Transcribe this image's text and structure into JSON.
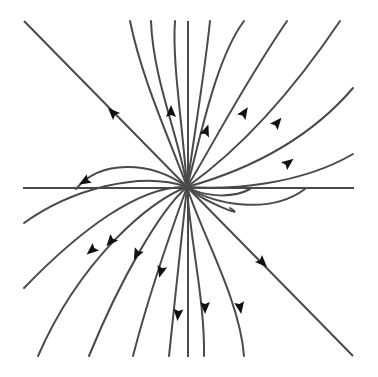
{
  "diagram": {
    "type": "phase-portrait",
    "colors": {
      "background": "#ffffff",
      "line": "#4a4a4a",
      "arrowhead": "#111111"
    },
    "center": [
      187,
      187
    ],
    "axes": {
      "horizontal": {
        "x1": 23,
        "y1": 188,
        "x2": 354,
        "y2": 188
      },
      "vertical": {
        "x1": 188,
        "y1": 21,
        "x2": 188,
        "y2": 357
      }
    },
    "eigenline": {
      "x1": 24,
      "y1": 21,
      "x2": 353,
      "y2": 356,
      "arrows": [
        [
          113,
          113,
          -1
        ],
        [
          262,
          262,
          1
        ]
      ]
    },
    "trajectories": [
      {
        "d": "M187,187 C170,140 142,80 130,21"
      },
      {
        "d": "M187,187 C180,140 153,80 151,21"
      },
      {
        "d": "M187,187 C182,120 172,60 175,21",
        "arrow": [
          171,
          112,
          -90
        ]
      },
      {
        "d": "M187,187 C195,130 205,70 210,21"
      },
      {
        "d": "M187,187 C200,140 215,60 244,21",
        "arrow": [
          206,
          131,
          -70
        ]
      },
      {
        "d": "M187,187 C210,150 240,90 287,21",
        "arrow": [
          244,
          113,
          -57
        ]
      },
      {
        "d": "M187,187 C225,160 280,110 340,21",
        "arrow": [
          277,
          123,
          -50
        ]
      },
      {
        "d": "M187,187 C230,175 300,150 353,88",
        "arrow": [
          288,
          163,
          -38
        ]
      },
      {
        "d": "M187,187 C230,190 300,185 353,154"
      },
      {
        "d": "M187,187 C150,160 100,160 76,189",
        "arrow": [
          85,
          181,
          150
        ]
      },
      {
        "d": "M187,187 C140,170 70,190 24,223"
      },
      {
        "d": "M187,187 C140,185 80,230 24,288",
        "arrow": [
          92,
          250,
          140
        ]
      },
      {
        "d": "M187,187 C150,200 80,260 38,356",
        "arrow": [
          111,
          241,
          130
        ]
      },
      {
        "d": "M187,187 C160,210 120,280 89,356",
        "arrow": [
          137,
          254,
          117
        ]
      },
      {
        "d": "M187,187 C175,220 150,290 133,356",
        "arrow": [
          161,
          271,
          105
        ]
      },
      {
        "d": "M187,187 C182,230 175,300 169,356",
        "arrow": [
          178,
          314,
          95
        ]
      },
      {
        "d": "M187,187 C190,240 205,300 204,356",
        "arrow": [
          205,
          307,
          90
        ]
      },
      {
        "d": "M187,187 C200,230 240,300 244,356",
        "arrow": [
          240,
          307,
          80
        ]
      },
      {
        "d": "M187,187 C200,200 250,220 230,208"
      },
      {
        "d": "M187,187 C215,205 270,215 305,189"
      },
      {
        "d": "M187,187 C200,195 230,200 250,189"
      }
    ]
  }
}
